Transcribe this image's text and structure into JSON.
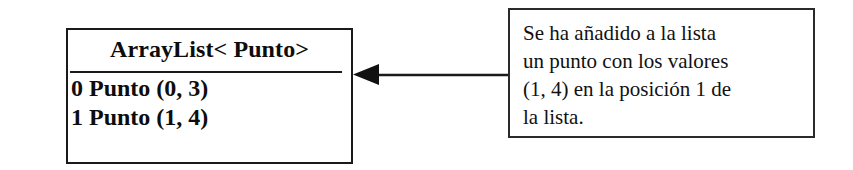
{
  "diagram": {
    "background_color": "#ffffff",
    "stroke_color": "#1a1a1a",
    "list_box": {
      "header": "ArrayList< Punto>",
      "rows": [
        "0 Punto (0, 3)",
        "1 Punto (1, 4)"
      ]
    },
    "arrow": {
      "direction": "left",
      "label": ""
    },
    "note_box": {
      "lines": [
        "Se ha añadido a la lista",
        "un punto con los valores",
        "(1, 4) en la posición 1 de",
        "la lista."
      ],
      "text": "Se ha añadido a la lista un punto con los valores (1, 4) en la posición 1 de la lista."
    }
  }
}
